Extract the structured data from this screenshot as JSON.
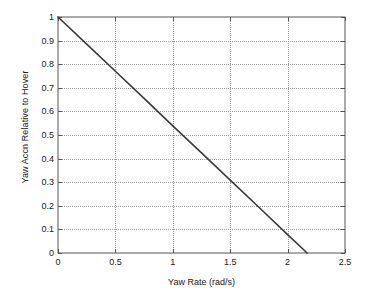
{
  "chart_data": {
    "type": "line",
    "title": "",
    "xlabel": "Yaw Rate (rad/s)",
    "ylabel": "Yaw Accn Relative to Hover",
    "xlim": [
      0,
      2.5
    ],
    "ylim": [
      0,
      1
    ],
    "xticks": [
      "0",
      "0.5",
      "1",
      "1.5",
      "2",
      "2.5"
    ],
    "xtick_values": [
      0,
      0.5,
      1,
      1.5,
      2,
      2.5
    ],
    "yticks": [
      "0",
      "0.1",
      "0.2",
      "0.3",
      "0.4",
      "0.5",
      "0.6",
      "0.7",
      "0.8",
      "0.9",
      "1"
    ],
    "ytick_values": [
      0,
      0.1,
      0.2,
      0.3,
      0.4,
      0.5,
      0.6,
      0.7,
      0.8,
      0.9,
      1
    ],
    "grid": true,
    "grid_style": "dotted",
    "legend": null,
    "series": [
      {
        "name": "Yaw Accn Relative to Hover",
        "color": "#3a3a3a",
        "x": [
          0,
          0.25,
          0.5,
          0.75,
          1,
          1.25,
          1.5,
          1.75,
          2,
          2.17
        ],
        "values": [
          1.0,
          0.885,
          0.77,
          0.655,
          0.539,
          0.424,
          0.309,
          0.194,
          0.078,
          0.0
        ]
      }
    ]
  },
  "axes": {
    "frame_color": "#555555",
    "grid_color": "#9a9a9a",
    "line_color": "#3a3a3a",
    "background": "#ffffff"
  }
}
